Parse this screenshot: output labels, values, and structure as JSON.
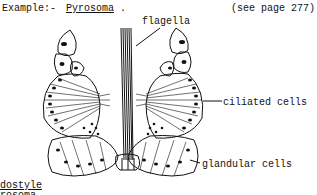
{
  "header": {
    "example_label": "Example:-",
    "example_name": "Pyrosoma",
    "example_period": ".",
    "page_ref": "(see page 277)"
  },
  "labels": {
    "flagella": "flagella",
    "ciliated_cells": "ciliated cells",
    "glandular_cells": "glandular cells"
  },
  "caption": {
    "line1": "dostyle",
    "line2": "rosoma"
  }
}
